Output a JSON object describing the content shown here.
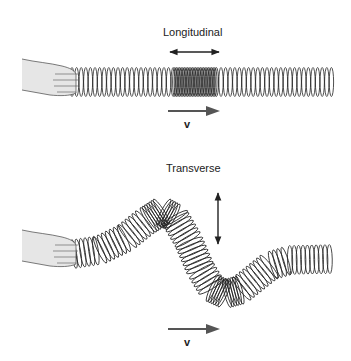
{
  "panels": [
    {
      "id": "longitudinal",
      "title": "Longitudinal",
      "motion_arrow": "horizontal-double-arrow",
      "velocity_label": "v",
      "velocity_arrow": "right-arrow",
      "spring": "compressed-region-in-middle",
      "hand": "hand-holding-spring"
    },
    {
      "id": "transverse",
      "title": "Transverse",
      "motion_arrow": "vertical-double-arrow",
      "velocity_label": "v",
      "velocity_arrow": "right-arrow",
      "spring": "sinusoidal-wave",
      "hand": "hand-holding-spring"
    }
  ],
  "colors": {
    "ink": "#222222",
    "arrow_fill": "#555555",
    "hand_fill": "#e6e6e6"
  }
}
